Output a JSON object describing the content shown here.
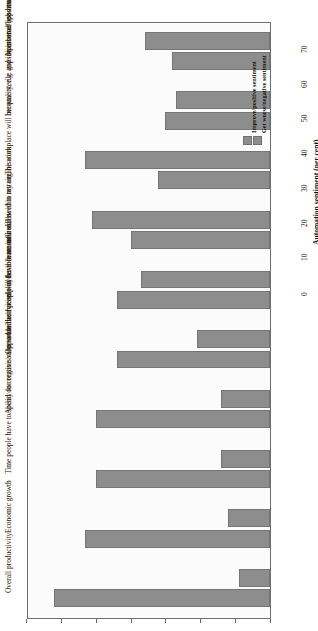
{
  "chart_data": {
    "type": "bar",
    "title": "",
    "subtitle": "",
    "orientation": "vertical-rotated",
    "xlabel": "",
    "ylabel": "Automation sentiment (per cent)",
    "ylim": [
      0,
      70
    ],
    "yticks": [
      0,
      10,
      20,
      30,
      40,
      50,
      60,
      70
    ],
    "grid": false,
    "legend_position": "top-right",
    "categories": [
      "Overall productivity",
      "Economic growth",
      "Time people have to spend on creative/value-added activities",
      "Ability for organisation to use their people in flexible manner",
      "Opportunities for employees to learn new skills",
      "I will have more influence within my organisation",
      "I will need to retrain",
      "The workplace will become sterile and impersonal/less human",
      "Inequality, e.g. gaps in income/opportunity",
      "Number of jobs available to people like you"
    ],
    "series": [
      {
        "name": "Improve/positive sentiment",
        "color": "#8d8d8d",
        "values": [
          62,
          53,
          50,
          50,
          44,
          44,
          40,
          32,
          30,
          28
        ]
      },
      {
        "name": "Get worse/negative sentiment",
        "color": "#8d8d8d",
        "values": [
          9,
          12,
          14,
          14,
          21,
          37,
          51,
          53,
          27,
          36
        ]
      }
    ]
  },
  "axis": {
    "value_axis_label": "Automation sentiment (per cent)",
    "tick_labels": [
      "0",
      "10",
      "20",
      "30",
      "40",
      "50",
      "60",
      "70"
    ]
  },
  "legend": {
    "entries": [
      {
        "label": "Improve/positive sentiment"
      },
      {
        "label": "Get worse/negative sentiment"
      }
    ]
  }
}
